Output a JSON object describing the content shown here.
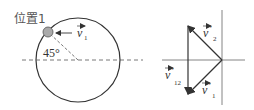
{
  "left_figure": {
    "position_label": "位置1",
    "angle_label": "45°",
    "velocity_label": {
      "symbol": "v",
      "subscript": "1",
      "prime": ""
    }
  },
  "right_figure": {
    "vectors": [
      {
        "name": "v2-prime",
        "symbol": "v",
        "prime": "′",
        "subscript": "2"
      },
      {
        "name": "v1-prime",
        "symbol": "v",
        "prime": "′",
        "subscript": "1"
      },
      {
        "name": "v12-prime",
        "symbol": "v",
        "prime": "′",
        "subscript": "12"
      }
    ]
  },
  "colors": {
    "line": "#333333",
    "ball": "#aaaaaa",
    "axis": "#666666"
  }
}
